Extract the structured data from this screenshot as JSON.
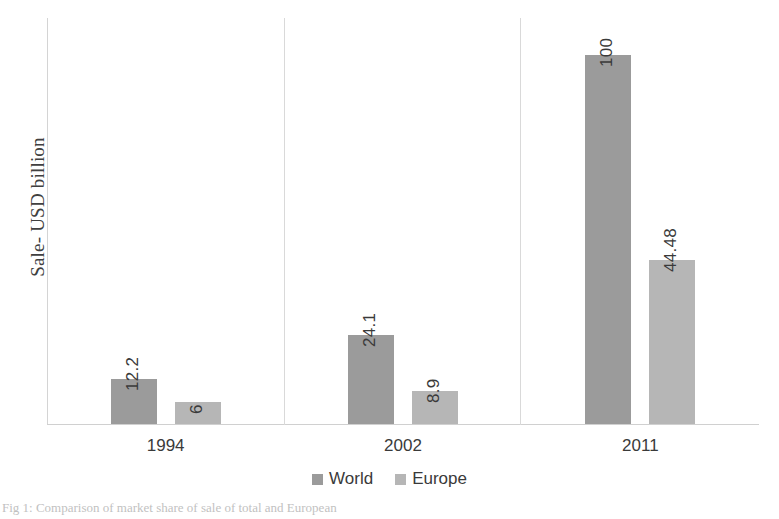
{
  "chart_data": {
    "type": "bar",
    "title": "",
    "xlabel": "",
    "ylabel": "Sale- USD billion",
    "categories": [
      "1994",
      "2002",
      "2011"
    ],
    "series": [
      {
        "name": "World",
        "color": "#9b9b9b",
        "values": [
          12.2,
          24.1,
          100
        ]
      },
      {
        "name": "Europe",
        "color": "#b6b6b6",
        "values": [
          6,
          8.9,
          44.48
        ]
      }
    ],
    "value_labels": [
      [
        "12.2",
        "6"
      ],
      [
        "24.1",
        "8.9"
      ],
      [
        "100",
        "44.48"
      ]
    ],
    "ylim": [
      0,
      110
    ],
    "y_tick_labels": [],
    "grid": false,
    "panel_separators": true,
    "legend_position": "bottom",
    "value_labels_rotated": true
  },
  "legend": {
    "items": [
      {
        "label": "World",
        "color": "#9b9b9b"
      },
      {
        "label": "Europe",
        "color": "#b6b6b6"
      }
    ]
  },
  "caption": {
    "text": "Fig 1: Comparison of market share of sale of total and European"
  }
}
